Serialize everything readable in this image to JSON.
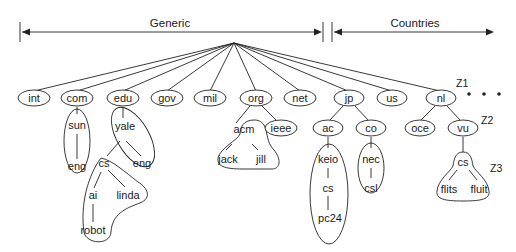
{
  "diagram": {
    "sections": {
      "generic": {
        "label": "Generic"
      },
      "countries": {
        "label": "Countries"
      }
    },
    "colors": {
      "stroke": "#222222",
      "text": "#1a1a1a",
      "background": "#ffffff"
    },
    "nodes": {
      "int": "int",
      "com": "com",
      "edu": "edu",
      "gov": "gov",
      "mil": "mil",
      "org": "org",
      "net": "net",
      "jp": "jp",
      "us": "us",
      "nl": "nl",
      "sun": "sun",
      "sun_eng": "eng",
      "yale": "yale",
      "yale_eng": "eng",
      "yale_cs": "cs",
      "ai": "ai",
      "linda": "linda",
      "robot": "robot",
      "acm": "acm",
      "ieee": "ieee",
      "jack": "jack",
      "jill": "jill",
      "ac": "ac",
      "co": "co",
      "keio": "keio",
      "keio_cs": "cs",
      "pc24": "pc24",
      "nec": "nec",
      "csl": "csl",
      "oce": "oce",
      "vu": "vu",
      "vu_cs": "cs",
      "flits": "flits",
      "fluit": "fluit"
    },
    "zone_labels": {
      "z1": "Z1",
      "z2": "Z2",
      "z3": "Z3"
    },
    "ellipsis": "• • •",
    "edges": [
      [
        "root",
        "int"
      ],
      [
        "root",
        "com"
      ],
      [
        "root",
        "edu"
      ],
      [
        "root",
        "gov"
      ],
      [
        "root",
        "mil"
      ],
      [
        "root",
        "org"
      ],
      [
        "root",
        "net"
      ],
      [
        "root",
        "jp"
      ],
      [
        "root",
        "us"
      ],
      [
        "root",
        "nl"
      ],
      [
        "com",
        "sun"
      ],
      [
        "sun",
        "sun_eng"
      ],
      [
        "edu",
        "yale"
      ],
      [
        "yale",
        "yale_eng"
      ],
      [
        "yale",
        "yale_cs"
      ],
      [
        "yale_cs",
        "ai"
      ],
      [
        "yale_cs",
        "linda"
      ],
      [
        "ai",
        "robot"
      ],
      [
        "org",
        "acm"
      ],
      [
        "org",
        "ieee"
      ],
      [
        "acm",
        "jack"
      ],
      [
        "acm",
        "jill"
      ],
      [
        "jp",
        "ac"
      ],
      [
        "jp",
        "co"
      ],
      [
        "ac",
        "keio"
      ],
      [
        "keio",
        "keio_cs"
      ],
      [
        "keio_cs",
        "pc24"
      ],
      [
        "co",
        "nec"
      ],
      [
        "nec",
        "csl"
      ],
      [
        "nl",
        "oce"
      ],
      [
        "nl",
        "vu"
      ],
      [
        "vu",
        "vu_cs"
      ],
      [
        "vu_cs",
        "flits"
      ],
      [
        "vu_cs",
        "fluit"
      ]
    ]
  }
}
